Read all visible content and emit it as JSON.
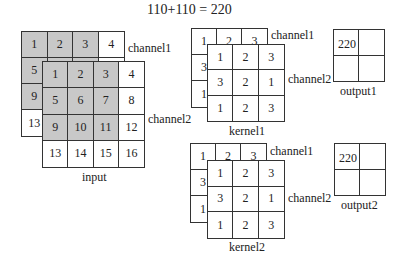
{
  "title": "110+110 = 220",
  "input": {
    "label": "input",
    "channel1": {
      "label": "channel1",
      "cells": [
        "1",
        "2",
        "3",
        "4",
        "5",
        "6",
        "7",
        "8",
        "9",
        "10",
        "11",
        "12",
        "13",
        "14",
        "15",
        "16"
      ],
      "shaded": [
        true,
        true,
        true,
        false,
        true,
        true,
        true,
        false,
        true,
        true,
        true,
        false,
        false,
        false,
        false,
        false
      ]
    },
    "channel2": {
      "label": "channel2",
      "cells": [
        "1",
        "2",
        "3",
        "4",
        "5",
        "6",
        "7",
        "8",
        "9",
        "10",
        "11",
        "12",
        "13",
        "14",
        "15",
        "16"
      ],
      "shaded": [
        true,
        true,
        true,
        false,
        true,
        true,
        true,
        false,
        true,
        true,
        true,
        false,
        false,
        false,
        false,
        false
      ]
    }
  },
  "kernel1": {
    "label": "kernel1",
    "channel1": {
      "label": "channel1",
      "cells": [
        "1",
        "2",
        "3",
        "3",
        "2",
        "1",
        "1",
        "2",
        "3"
      ]
    },
    "channel2": {
      "label": "channel2",
      "cells": [
        "1",
        "2",
        "3",
        "3",
        "2",
        "1",
        "1",
        "2",
        "3"
      ]
    }
  },
  "kernel2": {
    "label": "kernel2",
    "channel1": {
      "label": "channel1",
      "cells": [
        "1",
        "2",
        "3",
        "3",
        "2",
        "1",
        "1",
        "2",
        "3"
      ]
    },
    "channel2": {
      "label": "channel2",
      "cells": [
        "1",
        "2",
        "3",
        "3",
        "2",
        "1",
        "1",
        "2",
        "3"
      ]
    }
  },
  "output1": {
    "label": "output1",
    "cells": [
      "220",
      "",
      "",
      ""
    ]
  },
  "output2": {
    "label": "output2",
    "cells": [
      "220",
      "",
      "",
      ""
    ]
  },
  "colors": {
    "shaded": "#c8c8c8",
    "line": "#333333"
  }
}
